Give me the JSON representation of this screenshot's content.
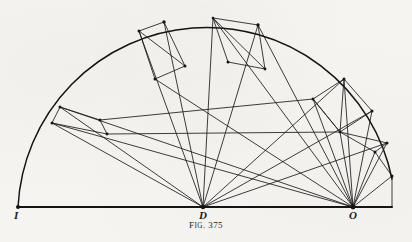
{
  "figure": {
    "caption_prefix": "F",
    "caption_smallcaps": "IG",
    "caption_suffix": ". 375",
    "caption_full": "FIG. 375",
    "background_color": "#f6f4f0",
    "ink_color": "#1b1b1b",
    "width": 412,
    "height": 242
  },
  "points": {
    "I": {
      "label": "I",
      "x": 18,
      "y": 207
    },
    "D": {
      "label": "D",
      "x": 203,
      "y": 207
    },
    "O": {
      "label": "O",
      "x": 353,
      "y": 207
    }
  },
  "baseline": {
    "name": "base-line",
    "x1": 18,
    "y1": 207,
    "x2": 392,
    "y2": 207
  },
  "arc": {
    "name": "semicircular-arc",
    "center_x": 203,
    "center_y": 207,
    "radius": 189,
    "start_angle_deg": 180,
    "end_angle_deg": 2
  },
  "rays_from_D": [
    {
      "name": "ray-D-1",
      "angle_deg": 164,
      "length": 189
    },
    {
      "name": "ray-D-2",
      "angle_deg": 157,
      "length": 189
    },
    {
      "name": "ray-D-3",
      "angle_deg": 122,
      "length": 189
    },
    {
      "name": "ray-D-4",
      "angle_deg": 113,
      "length": 189
    },
    {
      "name": "ray-D-5",
      "angle_deg": 93,
      "length": 189
    },
    {
      "name": "ray-D-6",
      "angle_deg": 73,
      "length": 189
    },
    {
      "name": "ray-D-7",
      "angle_deg": 37,
      "length": 189
    },
    {
      "name": "ray-D-8",
      "angle_deg": 26,
      "length": 189
    },
    {
      "name": "ray-D-9",
      "angle_deg": 13,
      "length": 189
    }
  ],
  "rays_from_O": [
    {
      "name": "ray-O-1",
      "tx": 152,
      "ty": 80
    },
    {
      "name": "ray-O-2",
      "tx": 118,
      "ty": 108
    },
    {
      "name": "ray-O-3",
      "tx": 72,
      "ty": 120
    },
    {
      "name": "ray-O-4",
      "tx": 60,
      "ty": 132
    },
    {
      "name": "ray-O-5",
      "tx": 305,
      "ty": 75
    },
    {
      "name": "ray-O-6",
      "tx": 327,
      "ty": 100
    },
    {
      "name": "ray-O-7",
      "tx": 345,
      "ty": 128
    },
    {
      "name": "ray-O-8",
      "tx": 372,
      "ty": 152
    },
    {
      "name": "ray-O-9",
      "tx": 392,
      "ty": 176
    }
  ],
  "nodes_on_arc": [
    {
      "name": "arc-node-a",
      "x": 52,
      "y": 123
    },
    {
      "name": "arc-node-b",
      "x": 60,
      "y": 107
    },
    {
      "name": "arc-node-c",
      "x": 139,
      "y": 31
    },
    {
      "name": "arc-node-d",
      "x": 164,
      "y": 22
    },
    {
      "name": "arc-node-e",
      "x": 213,
      "y": 18
    },
    {
      "name": "arc-node-f",
      "x": 258,
      "y": 25
    },
    {
      "name": "arc-node-g",
      "x": 271,
      "y": 29
    },
    {
      "name": "arc-node-h",
      "x": 344,
      "y": 79
    },
    {
      "name": "arc-node-i",
      "x": 372,
      "y": 111
    },
    {
      "name": "arc-node-j",
      "x": 387,
      "y": 143
    }
  ],
  "interior_nodes": [
    {
      "name": "node-k",
      "x": 100,
      "y": 120
    },
    {
      "name": "node-l",
      "x": 107,
      "y": 134
    },
    {
      "name": "node-m",
      "x": 155,
      "y": 79
    },
    {
      "name": "node-n",
      "x": 185,
      "y": 66
    },
    {
      "name": "node-o",
      "x": 228,
      "y": 62
    },
    {
      "name": "node-p",
      "x": 265,
      "y": 69
    },
    {
      "name": "node-q",
      "x": 313,
      "y": 99
    },
    {
      "name": "node-r",
      "x": 340,
      "y": 132
    },
    {
      "name": "node-s",
      "x": 375,
      "y": 152
    },
    {
      "name": "node-t",
      "x": 392,
      "y": 176
    }
  ]
}
